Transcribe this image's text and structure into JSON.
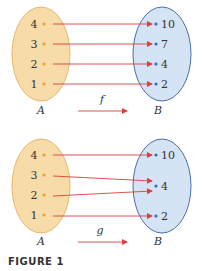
{
  "colors": {
    "set_a_fill": "#f7dcaa",
    "set_a_stroke": "#e8b86a",
    "set_a_dot": "#e8a030",
    "set_b_fill": "#d5e4f4",
    "set_b_stroke": "#4a6fae",
    "set_b_dot": "#2f6fb5",
    "arrow": "#d94040",
    "text": "#333333"
  },
  "diagrams": [
    {
      "function_label": "f",
      "domain_label": "A",
      "codomain_label": "B",
      "domain_elements": [
        "4",
        "3",
        "2",
        "1"
      ],
      "codomain_elements": [
        "10",
        "7",
        "4",
        "2"
      ],
      "mapping": [
        {
          "from": "4",
          "to": "10"
        },
        {
          "from": "3",
          "to": "7"
        },
        {
          "from": "2",
          "to": "4"
        },
        {
          "from": "1",
          "to": "2"
        }
      ]
    },
    {
      "function_label": "g",
      "domain_label": "A",
      "codomain_label": "B",
      "domain_elements": [
        "4",
        "3",
        "2",
        "1"
      ],
      "codomain_elements": [
        "10",
        "4",
        "2"
      ],
      "mapping": [
        {
          "from": "4",
          "to": "10"
        },
        {
          "from": "3",
          "to": "4"
        },
        {
          "from": "2",
          "to": "4"
        },
        {
          "from": "1",
          "to": "2"
        }
      ]
    }
  ],
  "caption": "FIGURE 1"
}
